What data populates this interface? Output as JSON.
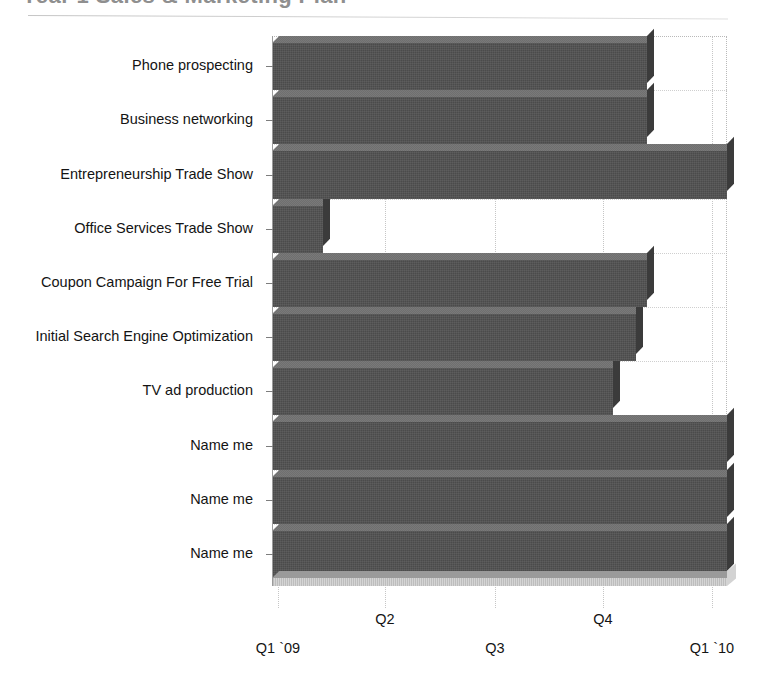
{
  "title": "Year 1 Sales & Marketing Plan",
  "chart_data": {
    "type": "bar",
    "orientation": "horizontal",
    "title": "Year 1 Sales & Marketing Plan",
    "xlabel": "",
    "ylabel": "",
    "grid": true,
    "legend": false,
    "x_tick_labels": [
      "Q1 `09",
      "Q2",
      "Q3",
      "Q4",
      "Q1 `10"
    ],
    "x_tick_values": [
      0,
      1,
      2,
      3,
      4
    ],
    "xlim": [
      0,
      4
    ],
    "categories": [
      "Phone prospecting",
      "Business networking",
      "Entrepreneurship Trade Show",
      "Office Services Trade Show",
      "Coupon Campaign For Free Trial",
      "Initial Search Engine Optimization",
      "TV ad production",
      "Name me",
      "Name me",
      "Name me"
    ],
    "values": [
      3.3,
      3.3,
      4.0,
      0.45,
      3.3,
      3.2,
      3.0,
      4.0,
      4.0,
      4.0
    ],
    "value_unit": "quarters",
    "bar_color": "#4b4b4b",
    "bar_top_color": "#6f6f6f",
    "bar_side_color": "#3b3b3b",
    "grid_color": "#c6c6c6",
    "axis_color": "#9b9b9b",
    "text_color": "#141414",
    "background": "#ffffff"
  },
  "x_axis": {
    "ticks": [
      {
        "label": "Q1 `09",
        "x": 278,
        "row": 1
      },
      {
        "label": "Q2",
        "x": 385,
        "row": 0
      },
      {
        "label": "Q3",
        "x": 495,
        "row": 1
      },
      {
        "label": "Q4",
        "x": 603,
        "row": 0
      },
      {
        "label": "Q1 `10",
        "x": 712,
        "row": 1
      }
    ]
  },
  "y_axis": {
    "items": [
      {
        "label": "Phone prospecting"
      },
      {
        "label": "Business networking"
      },
      {
        "label": "Entrepreneurship Trade Show"
      },
      {
        "label": "Office Services Trade Show"
      },
      {
        "label": "Coupon Campaign For Free Trial"
      },
      {
        "label": "Initial Search Engine Optimization"
      },
      {
        "label": "TV ad production"
      },
      {
        "label": "Name me"
      },
      {
        "label": "Name me"
      },
      {
        "label": "Name me"
      }
    ]
  }
}
